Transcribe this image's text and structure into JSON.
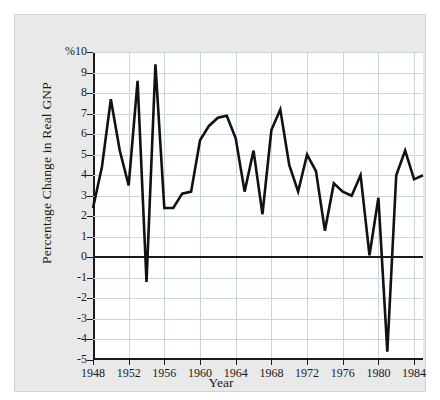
{
  "figure": {
    "caption_fragment": "",
    "background_color": "#e9e9e9",
    "plot_background_color": "#ffffff",
    "line_color": "#111111",
    "grid_color": "#c9d6e2",
    "axis_color": "#1a1a1a"
  },
  "axes": {
    "ylabel": "Percentage Change in Real GNP",
    "xlabel": "Year",
    "y_tick_labels": [
      "%10",
      "9",
      "8",
      "7",
      "6",
      "5",
      "4",
      "3",
      "2",
      "1",
      "0",
      "-1",
      "-2",
      "-3",
      "-4",
      "-5"
    ],
    "y_tick_values": [
      10,
      9,
      8,
      7,
      6,
      5,
      4,
      3,
      2,
      1,
      0,
      -1,
      -2,
      -3,
      -4,
      -5
    ],
    "x_tick_labels": [
      "1948",
      "1952",
      "1956",
      "1960",
      "1964",
      "1968",
      "1972",
      "1976",
      "1980",
      "1984"
    ],
    "x_tick_values": [
      1948,
      1952,
      1956,
      1960,
      1964,
      1968,
      1972,
      1976,
      1980,
      1984
    ]
  },
  "chart_data": {
    "type": "line",
    "title": "",
    "xlabel": "Year",
    "ylabel": "Percentage Change in Real GNP",
    "xlim": [
      1948,
      1985
    ],
    "ylim": [
      -5,
      10
    ],
    "grid": true,
    "legend": "none",
    "zero_reference_line": 0,
    "x": [
      1948,
      1949,
      1950,
      1951,
      1952,
      1953,
      1954,
      1955,
      1956,
      1957,
      1958,
      1959,
      1960,
      1961,
      1962,
      1963,
      1964,
      1965,
      1966,
      1967,
      1968,
      1969,
      1970,
      1971,
      1972,
      1973,
      1974,
      1975,
      1976,
      1977,
      1978,
      1979,
      1980,
      1981,
      1982,
      1983,
      1984,
      1985
    ],
    "values": [
      2.4,
      4.4,
      7.7,
      5.2,
      3.5,
      8.6,
      -1.2,
      9.4,
      2.4,
      2.4,
      3.1,
      3.2,
      5.7,
      6.4,
      6.8,
      6.9,
      5.8,
      3.2,
      5.2,
      2.1,
      6.2,
      7.2,
      4.5,
      3.2,
      5.0,
      4.2,
      1.3,
      3.6,
      3.2,
      3.0,
      4.0,
      0.1,
      2.9,
      -4.6,
      4.0,
      5.2,
      3.8,
      4.0
    ],
    "series": [
      {
        "name": "Percentage Change in Real GNP",
        "color": "#111111",
        "values": [
          2.4,
          4.4,
          7.7,
          5.2,
          3.5,
          8.6,
          -1.2,
          9.4,
          2.4,
          2.4,
          3.1,
          3.2,
          5.7,
          6.4,
          6.8,
          6.9,
          5.8,
          3.2,
          5.2,
          2.1,
          6.2,
          7.2,
          4.5,
          3.2,
          5.0,
          4.2,
          1.3,
          3.6,
          3.2,
          3.0,
          4.0,
          0.1,
          2.9,
          -4.6,
          4.0,
          5.2,
          3.8,
          4.0
        ]
      }
    ]
  }
}
